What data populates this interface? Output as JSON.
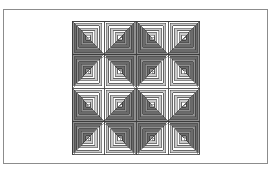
{
  "figure": {
    "kind": "line-art-diagram",
    "background_color": "#ffffff"
  },
  "frame": {
    "name": "figure-frame",
    "stroke_color": "#8c8c8c",
    "stroke_width": 1,
    "x": 3,
    "y": 9,
    "width": 265,
    "height": 155
  },
  "quilt": {
    "name": "log-cabin-quilt",
    "arrangement": "barn-raising",
    "rows": 4,
    "columns": 4,
    "block_count": 16,
    "x": 72,
    "y": 21,
    "width": 128,
    "height": 134,
    "block_width": 32,
    "block_height": 33.5,
    "rings_per_block": 7,
    "outline_color": "#3a3a3a",
    "light_fill": "#ffffff",
    "mid_fill": "#c9c9c9",
    "dark_fill": "#8f8f8f",
    "darkest_fill": "#6b6b6b",
    "center_fill": "#ffffff",
    "blocks": [
      {
        "row": 0,
        "col": 0,
        "dark_side": "br"
      },
      {
        "row": 0,
        "col": 1,
        "dark_side": "bl"
      },
      {
        "row": 0,
        "col": 2,
        "dark_side": "br"
      },
      {
        "row": 0,
        "col": 3,
        "dark_side": "bl"
      },
      {
        "row": 1,
        "col": 0,
        "dark_side": "tr"
      },
      {
        "row": 1,
        "col": 1,
        "dark_side": "tl"
      },
      {
        "row": 1,
        "col": 2,
        "dark_side": "tr"
      },
      {
        "row": 1,
        "col": 3,
        "dark_side": "tl"
      },
      {
        "row": 2,
        "col": 0,
        "dark_side": "br"
      },
      {
        "row": 2,
        "col": 1,
        "dark_side": "bl"
      },
      {
        "row": 2,
        "col": 2,
        "dark_side": "br"
      },
      {
        "row": 2,
        "col": 3,
        "dark_side": "bl"
      },
      {
        "row": 3,
        "col": 0,
        "dark_side": "tr"
      },
      {
        "row": 3,
        "col": 1,
        "dark_side": "tl"
      },
      {
        "row": 3,
        "col": 2,
        "dark_side": "tr"
      },
      {
        "row": 3,
        "col": 3,
        "dark_side": "tl"
      }
    ]
  }
}
